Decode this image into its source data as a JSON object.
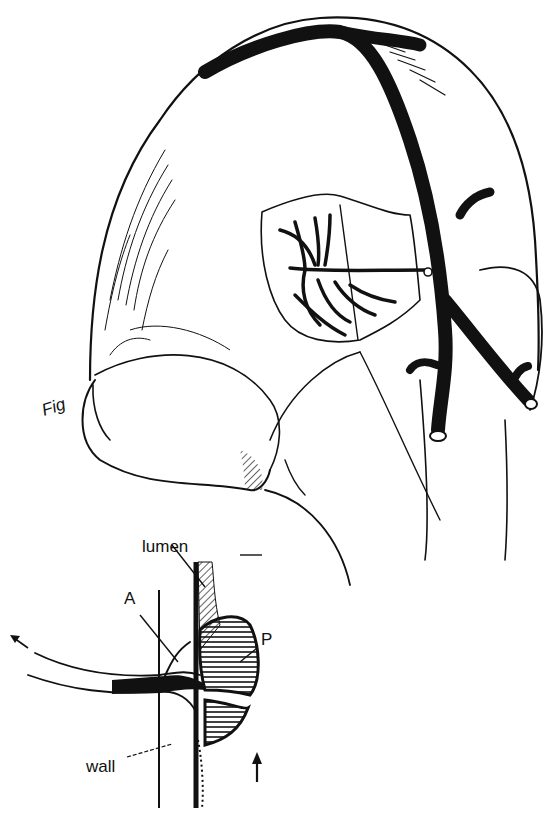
{
  "figure": {
    "colors": {
      "ink": "#111111",
      "background": "#ffffff"
    },
    "signature": "Fig",
    "inset": {
      "labels": {
        "lumen": "lumen",
        "a": "A",
        "p": "P",
        "wall": "wall"
      },
      "arrows": [
        "flow-arrow-left",
        "flow-arrow-up"
      ]
    }
  }
}
